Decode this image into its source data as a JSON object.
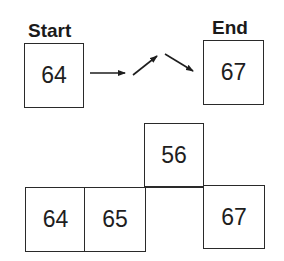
{
  "top": {
    "start_label": "Start",
    "end_label": "End",
    "start_value": "64",
    "end_value": "67"
  },
  "bottom": {
    "cells": [
      "64",
      "65",
      "56",
      "67"
    ]
  }
}
